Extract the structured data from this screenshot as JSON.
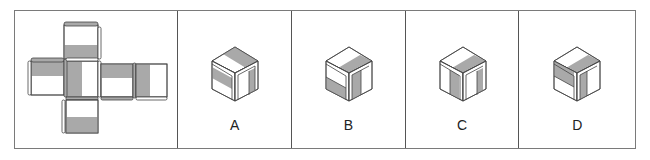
{
  "puzzle": {
    "type": "cube-net-folding",
    "colors": {
      "shade": "#a9a9a9",
      "face": "#ffffff",
      "edge": "#444444",
      "border": "#7a7a7a"
    },
    "net": {
      "label": "unfolded cube net",
      "faces": [
        {
          "id": "top",
          "pattern": "bottom-half-shaded"
        },
        {
          "id": "left",
          "pattern": "top-half-shaded"
        },
        {
          "id": "center",
          "pattern": "left-half-shaded"
        },
        {
          "id": "right-1",
          "pattern": "top-half-shaded"
        },
        {
          "id": "right-2",
          "pattern": "left-half-shaded"
        },
        {
          "id": "bottom",
          "pattern": "bottom-half-shaded"
        }
      ]
    },
    "options": [
      {
        "label": "A",
        "top": "right-half-shaded-diag",
        "left": "middle-band-shaded",
        "right": "right-strip-shaded"
      },
      {
        "label": "B",
        "top": "right-half-shaded-diag",
        "left": "bottom-half-shaded",
        "right": "left-half-shaded"
      },
      {
        "label": "C",
        "top": "right-half-shaded-diag",
        "left": "right-strip-shaded",
        "right": "right-strip-shaded"
      },
      {
        "label": "D",
        "top": "right-half-shaded-diag",
        "left": "top-half-shaded",
        "right": "left-strip-shaded"
      }
    ]
  }
}
